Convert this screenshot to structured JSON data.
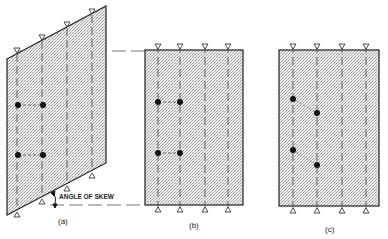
{
  "figure": {
    "panels": [
      {
        "id": "a",
        "caption": "(a)",
        "shape": "parallelogram",
        "vertices": [
          [
            7,
            59
          ],
          [
            106,
            6
          ],
          [
            106,
            163
          ],
          [
            7,
            215
          ]
        ],
        "girders_x": [
          17,
          42,
          67,
          92
        ],
        "top_supports_y": [
          53,
          40,
          27,
          14
        ],
        "bottom_supports_y": [
          212,
          199,
          186,
          173
        ],
        "points": [
          [
            18,
            105
          ],
          [
            43,
            105
          ],
          [
            18,
            155
          ],
          [
            43,
            155
          ]
        ],
        "links": [
          [
            0,
            1
          ],
          [
            2,
            3
          ]
        ],
        "annotation": "ANGLE OF SKEW"
      },
      {
        "id": "b",
        "caption": "(b)",
        "shape": "rectangle",
        "rect": [
          145,
          50,
          243,
          205
        ],
        "girders_x": [
          158,
          180,
          205,
          228
        ],
        "points": [
          [
            158,
            102
          ],
          [
            180,
            102
          ],
          [
            158,
            153
          ],
          [
            180,
            153
          ]
        ],
        "links": [
          [
            0,
            1
          ],
          [
            2,
            3
          ]
        ]
      },
      {
        "id": "c",
        "caption": "(c)",
        "shape": "rectangle",
        "rect": [
          279,
          50,
          379,
          206
        ],
        "girders_x": [
          293,
          317,
          342,
          366
        ],
        "points": [
          [
            293,
            99
          ],
          [
            317,
            113
          ],
          [
            293,
            150
          ],
          [
            317,
            165
          ]
        ],
        "links": [
          [
            0,
            1
          ],
          [
            2,
            3
          ]
        ]
      }
    ],
    "colors": {
      "line": "#222222",
      "fill": "#d9d9d9",
      "dash": "#555555"
    }
  }
}
